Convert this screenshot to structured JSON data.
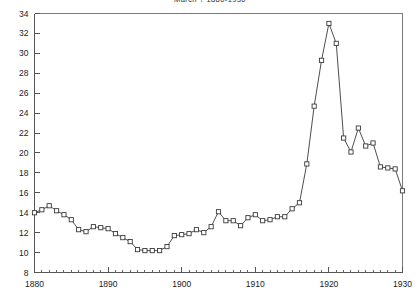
{
  "chart": {
    "title": "March ? 1880-1930",
    "axis": {
      "x_ticks": [
        "1880",
        "1890",
        "1900",
        "1910",
        "1920",
        "1930"
      ],
      "y_ticks": [
        "8",
        "10",
        "12",
        "14",
        "16",
        "18",
        "20",
        "22",
        "24",
        "26",
        "28",
        "30",
        "32",
        "34"
      ]
    }
  },
  "chart_data": {
    "type": "line",
    "title": "March ? 1880-1930",
    "xlabel": "",
    "ylabel": "",
    "xlim": [
      1880,
      1930
    ],
    "ylim": [
      8,
      34
    ],
    "grid": false,
    "legend": "none",
    "marker": "open-square",
    "x": [
      1880,
      1881,
      1882,
      1883,
      1884,
      1885,
      1886,
      1887,
      1888,
      1889,
      1890,
      1891,
      1892,
      1893,
      1894,
      1895,
      1896,
      1897,
      1898,
      1899,
      1900,
      1901,
      1902,
      1903,
      1904,
      1905,
      1906,
      1907,
      1908,
      1909,
      1910,
      1911,
      1912,
      1913,
      1914,
      1915,
      1916,
      1917,
      1918,
      1919,
      1920,
      1921,
      1922,
      1923,
      1924,
      1925,
      1926,
      1927,
      1928,
      1929,
      1930
    ],
    "values": [
      14.0,
      14.3,
      14.7,
      14.2,
      13.8,
      13.3,
      12.3,
      12.1,
      12.6,
      12.5,
      12.4,
      11.9,
      11.5,
      11.1,
      10.3,
      10.2,
      10.2,
      10.2,
      10.6,
      11.7,
      11.8,
      11.9,
      12.3,
      12.0,
      12.6,
      14.1,
      13.2,
      13.2,
      12.7,
      13.5,
      13.8,
      13.2,
      13.3,
      13.6,
      13.6,
      14.4,
      15.0,
      18.9,
      24.7,
      29.3,
      33.0,
      31.0,
      21.5,
      20.1,
      22.5,
      20.7,
      21.0,
      18.6,
      18.5,
      18.4,
      16.2
    ],
    "series": [
      {
        "name": "series-1",
        "values": [
          14.0,
          14.3,
          14.7,
          14.2,
          13.8,
          13.3,
          12.3,
          12.1,
          12.6,
          12.5,
          12.4,
          11.9,
          11.5,
          11.1,
          10.3,
          10.2,
          10.2,
          10.2,
          10.6,
          11.7,
          11.8,
          11.9,
          12.3,
          12.0,
          12.6,
          14.1,
          13.2,
          13.2,
          12.7,
          13.5,
          13.8,
          13.2,
          13.3,
          13.6,
          13.6,
          14.4,
          15.0,
          18.9,
          24.7,
          29.3,
          33.0,
          31.0,
          21.5,
          20.1,
          22.5,
          20.7,
          21.0,
          18.6,
          18.5,
          18.4,
          16.2
        ]
      }
    ]
  }
}
